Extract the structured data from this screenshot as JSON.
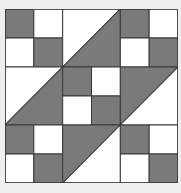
{
  "colors": {
    "background": "#efefef",
    "light": "#ffffff",
    "dark": "#7a7a7a",
    "line": "#3a3a3a"
  },
  "grid": {
    "cols": 6,
    "rows": 6
  },
  "units": [
    {
      "type": "checker",
      "col": 0,
      "row": 0,
      "cells": [
        "dark",
        "light",
        "light",
        "dark"
      ]
    },
    {
      "type": "hst",
      "col": 2,
      "row": 0,
      "upper_left": "light",
      "lower_right": "dark"
    },
    {
      "type": "checker",
      "col": 4,
      "row": 0,
      "cells": [
        "dark",
        "light",
        "light",
        "dark"
      ]
    },
    {
      "type": "hst",
      "col": 0,
      "row": 2,
      "upper_left": "light",
      "lower_right": "dark"
    },
    {
      "type": "checker",
      "col": 2,
      "row": 2,
      "cells": [
        "dark",
        "light",
        "light",
        "dark"
      ]
    },
    {
      "type": "hst",
      "col": 4,
      "row": 2,
      "upper_left": "dark",
      "lower_right": "light"
    },
    {
      "type": "checker",
      "col": 0,
      "row": 4,
      "cells": [
        "dark",
        "light",
        "light",
        "dark"
      ]
    },
    {
      "type": "hst",
      "col": 2,
      "row": 4,
      "upper_left": "dark",
      "lower_right": "light"
    },
    {
      "type": "checker",
      "col": 4,
      "row": 4,
      "cells": [
        "dark",
        "light",
        "light",
        "dark"
      ]
    }
  ]
}
